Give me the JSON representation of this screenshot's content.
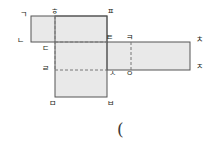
{
  "figure": {
    "fill_color": "#e9e9e9",
    "stroke_color": "#555555",
    "dash_color": "#777777",
    "background_color": "#ffffff",
    "trailing_text": "("
  },
  "vertices": [
    {
      "id": "v1",
      "label": "ㄱ",
      "x": 20,
      "y": 11
    },
    {
      "id": "v2",
      "label": "ㅎ",
      "x": 51,
      "y": 8
    },
    {
      "id": "v3",
      "label": "ㅍ",
      "x": 107,
      "y": 8
    },
    {
      "id": "v4",
      "label": "ㄴ",
      "x": 17,
      "y": 37
    },
    {
      "id": "v5",
      "label": "ㄷ",
      "x": 42,
      "y": 45
    },
    {
      "id": "v6",
      "label": "ㅌ",
      "x": 106,
      "y": 34
    },
    {
      "id": "v7",
      "label": "ㅋ",
      "x": 126,
      "y": 34
    },
    {
      "id": "v8",
      "label": "ㅊ",
      "x": 196,
      "y": 36
    },
    {
      "id": "v9",
      "label": "ㄹ",
      "x": 42,
      "y": 65
    },
    {
      "id": "v10",
      "label": "ㅅ",
      "x": 109,
      "y": 70
    },
    {
      "id": "v11",
      "label": "ㅇ",
      "x": 126,
      "y": 70
    },
    {
      "id": "v12",
      "label": "ㅈ",
      "x": 196,
      "y": 63
    },
    {
      "id": "v13",
      "label": "ㅁ",
      "x": 49,
      "y": 100
    },
    {
      "id": "v14",
      "label": "ㅂ",
      "x": 107,
      "y": 100
    }
  ],
  "rectangles": [
    {
      "id": "top-left-face",
      "x": 31,
      "y": 16,
      "width": 76,
      "height": 26
    },
    {
      "id": "center-face",
      "x": 55,
      "y": 16,
      "width": 52,
      "height": 81
    },
    {
      "id": "right-face",
      "x": 107,
      "y": 42,
      "width": 83,
      "height": 28
    }
  ],
  "dashed_lines": [
    {
      "id": "vertical-through-hieut",
      "x1": 55,
      "y1": 16,
      "x2": 55,
      "y2": 70
    },
    {
      "id": "horizontal-digeut-tieut",
      "x1": 55,
      "y1": 42,
      "x2": 107,
      "y2": 42
    },
    {
      "id": "horizontal-rieul-siot",
      "x1": 55,
      "y1": 70,
      "x2": 107,
      "y2": 70
    },
    {
      "id": "vertical-kieuk-ieung",
      "x1": 131,
      "y1": 42,
      "x2": 131,
      "y2": 70
    }
  ]
}
